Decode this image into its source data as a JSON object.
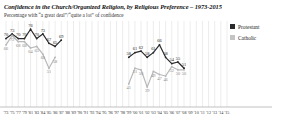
{
  "chart_data": {
    "type": "line",
    "title": "Confidence in the Church/Organized Religion, by Religious Preference – 1973-2015",
    "subtitle": "Percentage with “a great deal”/“quite a lot” of confidence",
    "xlabel": "",
    "ylabel": "",
    "ylim": [
      30,
      80
    ],
    "grid": true,
    "legend_position": "right",
    "colors": {
      "protestant": "#2b2b2b",
      "catholic": "#b9b9b9",
      "gridline": "#d8d8d8",
      "axis": "#999999",
      "label": "#333333"
    },
    "categories": [
      "'73",
      "'75",
      "'77",
      "'79",
      "'81",
      "'83",
      "'84",
      "'85",
      "'86",
      "'87",
      "'88",
      "'89",
      "'90",
      "'91",
      "'93",
      "'94",
      "'95",
      "'96",
      "'97",
      "'98",
      "'99",
      "'00",
      "'01",
      "'02",
      "'03",
      "'04",
      "'05",
      "'06",
      "'07",
      "'08",
      "'09",
      "'10",
      "'11",
      "'12",
      "'13",
      "'14",
      "'15"
    ],
    "series": [
      {
        "name": "Protestant",
        "color": "#2b2b2b",
        "values": [
          70,
          73,
          70,
          70,
          76,
          70,
          73,
          67,
          65,
          69,
          null,
          null,
          null,
          null,
          null,
          null,
          null,
          null,
          null,
          null,
          58,
          61,
          62,
          58,
          61,
          66,
          58,
          54,
          55,
          51,
          null,
          null,
          null,
          null,
          null,
          null,
          null
        ]
      },
      {
        "name": "Catholic",
        "color": "#b9b9b9",
        "values": [
          66,
          72,
          68,
          68,
          64,
          65,
          60,
          51,
          58,
          null,
          null,
          null,
          null,
          null,
          null,
          null,
          null,
          null,
          null,
          null,
          41,
          51,
          50,
          39,
          49,
          47,
          46,
          52,
          50,
          50,
          null,
          null,
          null,
          null,
          null,
          null,
          null
        ]
      }
    ],
    "point_labels": {
      "protestant": [
        {
          "x": 0,
          "y": 70,
          "text": "70"
        },
        {
          "x": 1,
          "y": 73,
          "text": "73"
        },
        {
          "x": 2,
          "y": 70,
          "text": "70"
        },
        {
          "x": 3,
          "y": 70,
          "text": "70"
        },
        {
          "x": 4,
          "y": 76,
          "text": "76"
        },
        {
          "x": 5,
          "y": 70,
          "text": "70"
        },
        {
          "x": 6,
          "y": 73,
          "text": "73"
        },
        {
          "x": 7,
          "y": 67,
          "text": "67"
        },
        {
          "x": 8,
          "y": 65,
          "text": "65"
        },
        {
          "x": 9,
          "y": 69,
          "text": "69"
        },
        {
          "x": 20,
          "y": 58,
          "text": "58"
        },
        {
          "x": 21,
          "y": 61,
          "text": "61"
        },
        {
          "x": 22,
          "y": 62,
          "text": "62"
        },
        {
          "x": 23,
          "y": 58,
          "text": "58"
        },
        {
          "x": 24,
          "y": 61,
          "text": "61"
        },
        {
          "x": 25,
          "y": 66,
          "text": "66"
        },
        {
          "x": 26,
          "y": 58,
          "text": "58"
        },
        {
          "x": 27,
          "y": 54,
          "text": "54"
        },
        {
          "x": 28,
          "y": 55,
          "text": "55"
        },
        {
          "x": 29,
          "y": 51,
          "text": "51"
        }
      ],
      "catholic": [
        {
          "x": 0,
          "y": 66,
          "text": "66"
        },
        {
          "x": 1,
          "y": 72,
          "text": "72"
        },
        {
          "x": 2,
          "y": 68,
          "text": "68"
        },
        {
          "x": 3,
          "y": 68,
          "text": "68"
        },
        {
          "x": 4,
          "y": 64,
          "text": "64"
        },
        {
          "x": 5,
          "y": 65,
          "text": "65"
        },
        {
          "x": 6,
          "y": 60,
          "text": "60"
        },
        {
          "x": 7,
          "y": 51,
          "text": "51"
        },
        {
          "x": 8,
          "y": 58,
          "text": "58"
        },
        {
          "x": 20,
          "y": 41,
          "text": "41"
        },
        {
          "x": 21,
          "y": 51,
          "text": "51"
        },
        {
          "x": 22,
          "y": 50,
          "text": "50"
        },
        {
          "x": 23,
          "y": 39,
          "text": "39"
        },
        {
          "x": 24,
          "y": 49,
          "text": "49"
        },
        {
          "x": 25,
          "y": 47,
          "text": "47"
        },
        {
          "x": 26,
          "y": 46,
          "text": "46"
        },
        {
          "x": 27,
          "y": 52,
          "text": "52"
        },
        {
          "x": 28,
          "y": 50,
          "text": "50"
        },
        {
          "x": 29,
          "y": 50,
          "text": "50"
        }
      ]
    }
  },
  "legend": {
    "items": [
      {
        "label": "Protestant",
        "color": "#2b2b2b"
      },
      {
        "label": "Catholic",
        "color": "#c4c4c4"
      }
    ]
  }
}
